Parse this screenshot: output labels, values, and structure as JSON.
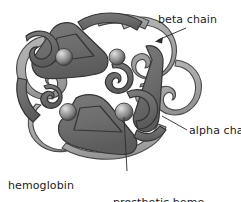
{
  "figure": {
    "background_color": "#ffffff",
    "width": 241,
    "height": 202
  },
  "colors": {
    "alpha_chain_fill": "#6f6f6f",
    "alpha_chain_shade": "#5a5a5a",
    "beta_chain_fill": "#a9a9a9",
    "beta_chain_shade": "#949494",
    "outline": "#3d3d3d",
    "heme_sphere_highlight": "#d8d8d8",
    "heme_sphere_mid": "#8a8a8a",
    "heme_sphere_edge": "#4a4a4a",
    "leader_line": "#2b2b2b",
    "label_text": "#1a1a1a"
  },
  "labels": {
    "beta_chain": "beta chain",
    "alpha_chain": "alpha chain",
    "hemoglobin_line1": "hemoglobin",
    "hemoglobin_line2": "molecule",
    "heme_line1": "prosthetic heme",
    "heme_line2": "group"
  },
  "heme_groups": [
    {
      "name": "heme-top-left",
      "cx": 64,
      "cy": 57,
      "r": 8.5
    },
    {
      "name": "heme-top-right",
      "cx": 117,
      "cy": 57,
      "r": 8.0
    },
    {
      "name": "heme-bottom-left",
      "cx": 68,
      "cy": 112,
      "r": 8.5
    },
    {
      "name": "heme-bottom-right",
      "cx": 124,
      "cy": 112,
      "r": 9.0
    }
  ],
  "leaders": {
    "beta_chain": {
      "from_x": 186,
      "from_y": 28,
      "to_x": 156,
      "to_y": 41,
      "arrowhead": true
    },
    "alpha_chain": {
      "from_x": 187,
      "from_y": 130,
      "to_x": 162,
      "to_y": 116,
      "arrowhead": false
    },
    "heme": {
      "from_x": 127,
      "from_y": 171,
      "to_x": 124,
      "to_y": 116,
      "arrowhead": false
    }
  }
}
